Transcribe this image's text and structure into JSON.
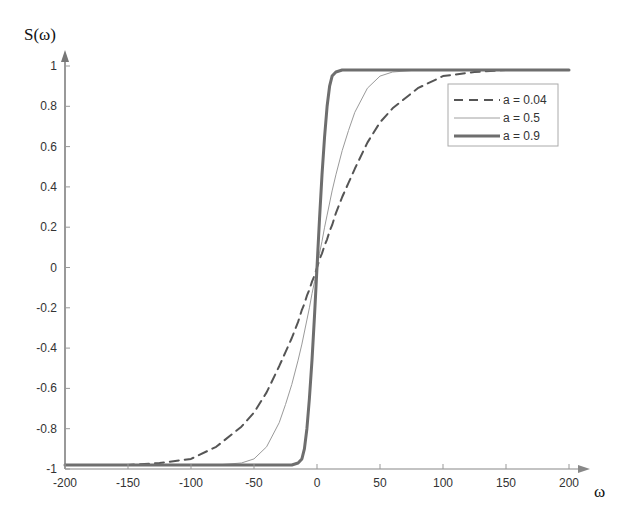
{
  "chart_data": {
    "type": "line",
    "title": "",
    "xlabel": "ω",
    "ylabel": "S(ω)",
    "xlim": [
      -200,
      200
    ],
    "ylim": [
      -1,
      1
    ],
    "x_ticks": [
      -200,
      -150,
      -100,
      -50,
      0,
      50,
      100,
      150,
      200
    ],
    "x_tick_labels": [
      "-200",
      "-150",
      "-100",
      "-50",
      "0",
      "50",
      "100",
      "150",
      "200"
    ],
    "y_ticks": [
      -1,
      -0.8,
      -0.6,
      -0.4,
      -0.2,
      0,
      0.2,
      0.4,
      0.6,
      0.8,
      1
    ],
    "y_tick_labels": [
      "-1",
      "-0.8",
      "-0.6",
      "-0.4",
      "-0.2",
      "0",
      "0.2",
      "0.4",
      "0.6",
      "0.8",
      "1"
    ],
    "grid": false,
    "legend_position": "upper right",
    "x": [
      -200,
      -175,
      -150,
      -125,
      -100,
      -80,
      -60,
      -50,
      -40,
      -30,
      -25,
      -20,
      -15,
      -12,
      -10,
      -8,
      -6,
      -4,
      -2,
      0,
      2,
      4,
      6,
      8,
      10,
      12,
      15,
      20,
      25,
      30,
      40,
      50,
      60,
      80,
      100,
      125,
      150,
      175,
      200
    ],
    "series": [
      {
        "name": "a = 0.04",
        "style": "dashed",
        "color": "#555555",
        "width": 2,
        "values": [
          -0.98,
          -0.98,
          -0.98,
          -0.97,
          -0.95,
          -0.89,
          -0.79,
          -0.72,
          -0.62,
          -0.49,
          -0.42,
          -0.35,
          -0.27,
          -0.21,
          -0.18,
          -0.14,
          -0.11,
          -0.07,
          -0.04,
          0,
          0.04,
          0.07,
          0.11,
          0.14,
          0.18,
          0.21,
          0.27,
          0.35,
          0.42,
          0.49,
          0.62,
          0.72,
          0.79,
          0.89,
          0.95,
          0.97,
          0.98,
          0.98,
          0.98
        ]
      },
      {
        "name": "a = 0.5",
        "style": "solid",
        "color": "#9a9a9a",
        "width": 1,
        "values": [
          -0.98,
          -0.98,
          -0.98,
          -0.98,
          -0.98,
          -0.98,
          -0.97,
          -0.95,
          -0.89,
          -0.77,
          -0.68,
          -0.58,
          -0.46,
          -0.38,
          -0.32,
          -0.26,
          -0.2,
          -0.13,
          -0.07,
          0,
          0.07,
          0.13,
          0.2,
          0.26,
          0.32,
          0.38,
          0.46,
          0.58,
          0.68,
          0.77,
          0.89,
          0.95,
          0.97,
          0.98,
          0.98,
          0.98,
          0.98,
          0.98,
          0.98
        ]
      },
      {
        "name": "a = 0.9",
        "style": "solid-thick",
        "color": "#6e6e6e",
        "width": 3,
        "values": [
          -0.98,
          -0.98,
          -0.98,
          -0.98,
          -0.98,
          -0.98,
          -0.98,
          -0.98,
          -0.98,
          -0.98,
          -0.98,
          -0.98,
          -0.97,
          -0.95,
          -0.9,
          -0.8,
          -0.65,
          -0.46,
          -0.24,
          0,
          0.24,
          0.46,
          0.65,
          0.8,
          0.9,
          0.95,
          0.97,
          0.98,
          0.98,
          0.98,
          0.98,
          0.98,
          0.98,
          0.98,
          0.98,
          0.98,
          0.98,
          0.98,
          0.98
        ]
      }
    ]
  },
  "axes": {
    "ylabel": "S(ω)",
    "xlabel": "ω"
  },
  "legend": {
    "items": [
      {
        "label": "a = 0.04"
      },
      {
        "label": "a = 0.5"
      },
      {
        "label": "a = 0.9"
      }
    ]
  }
}
